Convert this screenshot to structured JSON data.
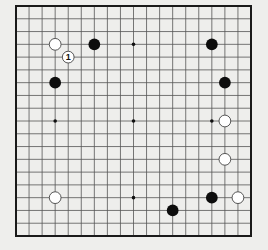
{
  "board": {
    "size": 19,
    "left": 16,
    "top": 6,
    "right": 251,
    "bottom": 236,
    "line_color": "#555555",
    "border_color": "#1a1a1a",
    "background": "#eeeeec",
    "star_points": [
      [
        3,
        3
      ],
      [
        9,
        3
      ],
      [
        15,
        3
      ],
      [
        3,
        9
      ],
      [
        9,
        9
      ],
      [
        15,
        9
      ],
      [
        3,
        15
      ],
      [
        9,
        15
      ],
      [
        15,
        15
      ]
    ]
  },
  "stones": [
    {
      "color": "white",
      "col": 3,
      "row": 3,
      "label": ""
    },
    {
      "color": "white",
      "col": 4,
      "row": 4,
      "label": "1"
    },
    {
      "color": "black",
      "col": 6,
      "row": 3,
      "label": ""
    },
    {
      "color": "black",
      "col": 3,
      "row": 6,
      "label": ""
    },
    {
      "color": "black",
      "col": 15,
      "row": 3,
      "label": ""
    },
    {
      "color": "black",
      "col": 16,
      "row": 6,
      "label": ""
    },
    {
      "color": "white",
      "col": 16,
      "row": 9,
      "label": ""
    },
    {
      "color": "white",
      "col": 16,
      "row": 12,
      "label": ""
    },
    {
      "color": "black",
      "col": 15,
      "row": 15,
      "label": ""
    },
    {
      "color": "white",
      "col": 17,
      "row": 15,
      "label": ""
    },
    {
      "color": "black",
      "col": 12,
      "row": 16,
      "label": ""
    },
    {
      "color": "white",
      "col": 3,
      "row": 15,
      "label": ""
    }
  ]
}
